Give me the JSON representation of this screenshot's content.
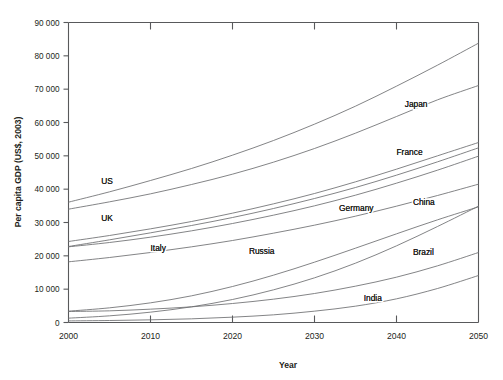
{
  "chart_data": {
    "type": "line",
    "title": "",
    "xlabel": "Year",
    "ylabel": "Per capita GDP (US$, 2003)",
    "xlim": [
      2000,
      2050
    ],
    "ylim": [
      0,
      90000
    ],
    "grid": false,
    "legend_position": "inline-labels",
    "x": [
      2000,
      2005,
      2010,
      2015,
      2020,
      2025,
      2030,
      2035,
      2040,
      2045,
      2050
    ],
    "xticks": [
      "2000",
      "2010",
      "2020",
      "2030",
      "2040",
      "2050"
    ],
    "yticks": [
      "0",
      "10 000",
      "20 000",
      "30 000",
      "40 000",
      "50 000",
      "60 000",
      "70 000",
      "80 000",
      "90 000"
    ],
    "series": [
      {
        "name": "US",
        "label": "US",
        "values": [
          36100,
          39200,
          42600,
          46200,
          50200,
          54600,
          59500,
          64900,
          70900,
          77200,
          83800
        ]
      },
      {
        "name": "Japan",
        "label": "Japan",
        "values": [
          34000,
          36200,
          38600,
          41400,
          44500,
          48100,
          52200,
          56800,
          61800,
          66800,
          71100
        ]
      },
      {
        "name": "France",
        "label": "France",
        "values": [
          24300,
          26100,
          28100,
          30300,
          32800,
          35600,
          38700,
          42200,
          46000,
          50000,
          54000
        ]
      },
      {
        "name": "Germany",
        "label": "Germany",
        "values": [
          22700,
          24000,
          25600,
          27500,
          29700,
          32200,
          35000,
          38200,
          41800,
          45700,
          49900
        ]
      },
      {
        "name": "UK",
        "label": "UK",
        "values": [
          22800,
          24800,
          26900,
          29100,
          31500,
          34200,
          37200,
          40500,
          44200,
          48200,
          52400
        ]
      },
      {
        "name": "Italy",
        "label": "Italy",
        "values": [
          18200,
          19500,
          21000,
          22700,
          24600,
          26800,
          29200,
          31900,
          34900,
          38100,
          41500
        ]
      },
      {
        "name": "China",
        "label": "China",
        "values": [
          1300,
          2000,
          3100,
          4700,
          6900,
          9800,
          13400,
          17800,
          23000,
          28800,
          34900
        ]
      },
      {
        "name": "Russia",
        "label": "Russia",
        "values": [
          3400,
          4400,
          5900,
          8000,
          10800,
          14200,
          18100,
          22300,
          26600,
          30800,
          34700
        ]
      },
      {
        "name": "Brazil",
        "label": "Brazil",
        "values": [
          3300,
          3500,
          4000,
          4700,
          5700,
          7000,
          8700,
          10900,
          13600,
          17000,
          21000
        ]
      },
      {
        "name": "India",
        "label": "India",
        "values": [
          480,
          600,
          800,
          1100,
          1600,
          2300,
          3400,
          4900,
          7100,
          10200,
          14100
        ]
      }
    ],
    "annotations": [
      {
        "text": "US",
        "x": 2004,
        "y": 41500
      },
      {
        "text": "UK",
        "x": 2004,
        "y": 30400
      },
      {
        "text": "Italy",
        "x": 2010,
        "y": 21600
      },
      {
        "text": "Russia",
        "x": 2022,
        "y": 20500
      },
      {
        "text": "Germany",
        "x": 2033,
        "y": 33600
      },
      {
        "text": "Japan",
        "x": 2041,
        "y": 64700
      },
      {
        "text": "France",
        "x": 2040,
        "y": 50300
      },
      {
        "text": "China",
        "x": 2042,
        "y": 35200
      },
      {
        "text": "Brazil",
        "x": 2042,
        "y": 20400
      },
      {
        "text": "India",
        "x": 2036,
        "y": 6400
      }
    ]
  },
  "figure": {
    "y_axis_title": "Per capita GDP (US$, 2003)",
    "x_axis_title": "Year",
    "caption": ""
  }
}
